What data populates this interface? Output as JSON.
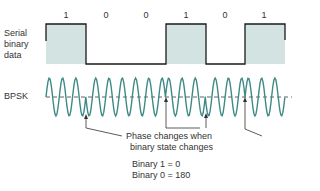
{
  "labels": {
    "serial": [
      "Serial",
      "binary",
      "data"
    ],
    "bpsk": "BPSK"
  },
  "bits": [
    "1",
    "0",
    "0",
    "1",
    "0",
    "1"
  ],
  "caption": [
    "Phase changes when",
    "binary state changes"
  ],
  "legend": [
    "Binary 1 = 0",
    "Binary 0 = 180"
  ],
  "colors": {
    "pulse_fill": "#d3e3e1",
    "line": "#1a1a1a",
    "wave": "#3e8a86",
    "axis": "#3a3a3a"
  }
}
